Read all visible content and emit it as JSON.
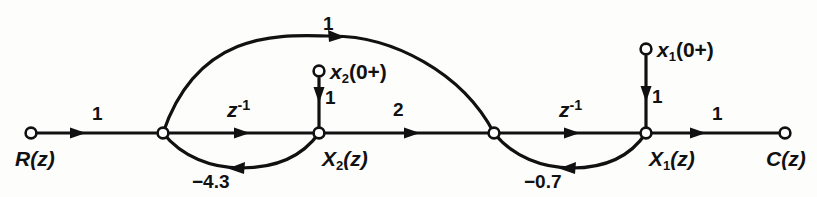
{
  "figure": {
    "type": "signal-flow-graph",
    "colors": {
      "stroke": "#111111",
      "background": "#fdfdfc",
      "node_fill": "#ffffff"
    }
  },
  "nodes": [
    {
      "id": "R",
      "label_html": "R(z)",
      "label_plain": "R(z)",
      "x": 31,
      "y": 133,
      "label_x": 15,
      "label_y": 148,
      "type": "source"
    },
    {
      "id": "J1",
      "label_html": "",
      "label_plain": "",
      "x": 163,
      "y": 133,
      "label_x": 0,
      "label_y": 0,
      "type": "junction"
    },
    {
      "id": "X2",
      "label_html": "X2(z)",
      "label_plain": "X2(z)",
      "x": 319,
      "y": 133,
      "label_x": 322,
      "label_y": 148,
      "type": "state"
    },
    {
      "id": "J2",
      "label_html": "",
      "label_plain": "",
      "x": 494,
      "y": 133,
      "label_x": 0,
      "label_y": 0,
      "type": "junction"
    },
    {
      "id": "X1",
      "label_html": "X1(z)",
      "label_plain": "X1(z)",
      "x": 646,
      "y": 133,
      "label_x": 649,
      "label_y": 148,
      "type": "state"
    },
    {
      "id": "C",
      "label_html": "C(z)",
      "label_plain": "C(z)",
      "x": 785,
      "y": 133,
      "label_x": 766,
      "label_y": 148,
      "type": "sink"
    },
    {
      "id": "x2init",
      "label_html": "x2(0+)",
      "label_plain": "x2(0+)",
      "x": 319,
      "y": 71,
      "label_x": 330,
      "label_y": 61,
      "type": "initial-condition"
    },
    {
      "id": "x1init",
      "label_html": "x1(0+)",
      "label_plain": "x1(0+)",
      "x": 646,
      "y": 49,
      "label_x": 657,
      "label_y": 39,
      "type": "initial-condition"
    }
  ],
  "edges": [
    {
      "id": "e-R-J1",
      "from": "R",
      "to": "J1",
      "gain": "1",
      "shape": "straight",
      "label_x": 92,
      "label_y": 104
    },
    {
      "id": "e-J1-X2",
      "from": "J1",
      "to": "X2",
      "gain": "z-1",
      "shape": "straight",
      "label_x": 227,
      "label_y": 101
    },
    {
      "id": "e-X2-J2",
      "from": "X2",
      "to": "J2",
      "gain": "2",
      "shape": "straight",
      "label_x": 393,
      "label_y": 100
    },
    {
      "id": "e-J2-X1",
      "from": "J2",
      "to": "X1",
      "gain": "z-1",
      "shape": "straight",
      "label_x": 559,
      "label_y": 101
    },
    {
      "id": "e-X1-C",
      "from": "X1",
      "to": "C",
      "gain": "1",
      "shape": "straight",
      "label_x": 712,
      "label_y": 104
    },
    {
      "id": "e-J1-J2-top",
      "from": "J1",
      "to": "J2",
      "gain": "1",
      "shape": "arc-up",
      "label_x": 323,
      "label_y": 14
    },
    {
      "id": "e-X2-J1-bot",
      "from": "X2",
      "to": "J1",
      "gain": "-4.3",
      "shape": "arc-down",
      "label_x": 210,
      "label_y": 172
    },
    {
      "id": "e-X1-J2-bot",
      "from": "X1",
      "to": "J2",
      "gain": "-0.7",
      "shape": "arc-down",
      "label_x": 541,
      "label_y": 172
    },
    {
      "id": "e-x2i-X2",
      "from": "x2init",
      "to": "X2",
      "gain": "1",
      "shape": "vertical",
      "label_x": 325,
      "label_y": 88
    },
    {
      "id": "e-x1i-X1",
      "from": "x1init",
      "to": "X1",
      "gain": "1",
      "shape": "vertical",
      "label_x": 652,
      "label_y": 87
    }
  ],
  "gain_labels": {
    "one": "1",
    "two": "2",
    "z_inverse_base": "z",
    "z_inverse_exp": "-1",
    "neg_4_3": "−4.3",
    "neg_0_7": "−0.7"
  },
  "node_labels": {
    "R": "R(z)",
    "C": "C(z)",
    "X2_base": "X",
    "X2_sub": "2",
    "X2_arg": "(z)",
    "X1_base": "X",
    "X1_sub": "1",
    "X1_arg": "(z)",
    "x2init_base": "x",
    "x2init_sub": "2",
    "x2init_arg": "(0+)",
    "x1init_base": "x",
    "x1init_sub": "1",
    "x1init_arg": "(0+)"
  }
}
